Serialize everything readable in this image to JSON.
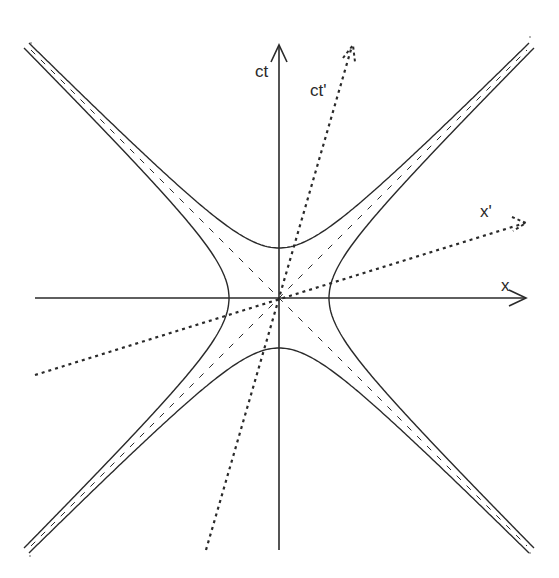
{
  "diagram": {
    "type": "minkowski-spacetime-diagram",
    "labels": {
      "time_axis": "ct",
      "space_axis": "x",
      "boosted_time_axis": "ct'",
      "boosted_space_axis": "x'"
    },
    "origin": [
      279,
      298
    ],
    "hyperbola_vertex_distance_px": 50,
    "elements": [
      {
        "name": "ct-axis",
        "style": "solid",
        "arrow": true
      },
      {
        "name": "x-axis",
        "style": "solid",
        "arrow": true
      },
      {
        "name": "ct-prime-axis",
        "style": "dotted",
        "arrow": true
      },
      {
        "name": "x-prime-axis",
        "style": "dotted",
        "arrow": true
      },
      {
        "name": "light-cone-diagonals",
        "style": "dashed",
        "count": 2
      },
      {
        "name": "timelike-hyperbola-upper",
        "style": "solid"
      },
      {
        "name": "timelike-hyperbola-lower",
        "style": "solid"
      },
      {
        "name": "spacelike-hyperbola-left",
        "style": "solid"
      },
      {
        "name": "spacelike-hyperbola-right",
        "style": "solid"
      }
    ],
    "colors": {
      "stroke": "#2a2a2a",
      "background": "#ffffff"
    }
  }
}
